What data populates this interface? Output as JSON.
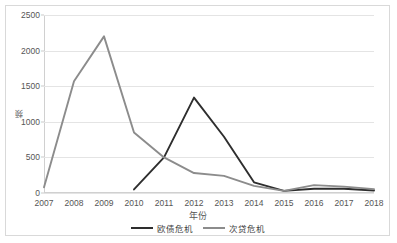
{
  "chart_data": {
    "type": "line",
    "title": "",
    "xlabel": "年份",
    "ylabel": "频",
    "ylim": [
      0,
      2500
    ],
    "yticks": [
      0,
      500,
      1000,
      1500,
      2000,
      2500
    ],
    "ytick_labels": [
      "0",
      "500",
      "1000",
      "1500",
      "2000",
      "2500"
    ],
    "grid": "horizontal",
    "legend_position": "bottom",
    "categories": [
      "2007",
      "2008",
      "2009",
      "2010",
      "2011",
      "2012",
      "2013",
      "2014",
      "2015",
      "2016",
      "2017",
      "2018"
    ],
    "series": [
      {
        "name": "欧债危机",
        "color": "#2e2e2e",
        "values": [
          null,
          null,
          null,
          50,
          500,
          1340,
          790,
          150,
          30,
          60,
          60,
          35
        ]
      },
      {
        "name": "次贷危机",
        "color": "#8c8c8c",
        "values": [
          80,
          1570,
          2200,
          850,
          500,
          280,
          240,
          100,
          30,
          110,
          90,
          55
        ]
      }
    ]
  },
  "legend": {
    "items": [
      {
        "label": "欧债危机",
        "color": "#2e2e2e"
      },
      {
        "label": "次贷危机",
        "color": "#8c8c8c"
      }
    ]
  },
  "axes": {
    "y_title": "频",
    "x_title": "年份"
  }
}
